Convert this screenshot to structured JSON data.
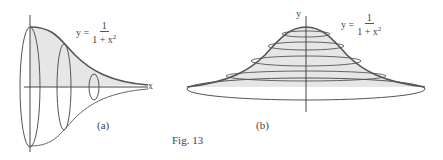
{
  "figure": {
    "caption": "Fig. 13",
    "panels": [
      {
        "id": "a",
        "label": "(a)",
        "equation": {
          "lhs": "y =",
          "numerator": "1",
          "denominator_base": "1 + x",
          "denominator_exp": "2"
        },
        "axis_label_x": "x",
        "description": "Solid of revolution about x-axis: horn-shaped surface with three elliptical cross sections"
      },
      {
        "id": "b",
        "label": "(b)",
        "equation": {
          "lhs": "y =",
          "numerator": "1",
          "denominator_base": "1 + x",
          "denominator_exp": "2"
        },
        "axis_label_y": "y",
        "description": "Solid of revolution about y-axis: bell-shaped surface with horizontal elliptical cross sections"
      }
    ],
    "colors": {
      "fill": "#e6e6e6",
      "curve": "#555555",
      "axis": "#444444"
    }
  }
}
